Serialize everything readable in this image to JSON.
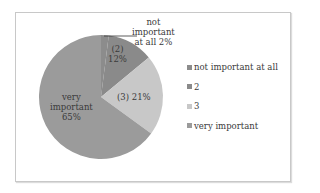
{
  "chart_data": {
    "type": "pie",
    "title": "",
    "categories": [
      "not important at all",
      "2",
      "3",
      "very important"
    ],
    "values": [
      2,
      12,
      21,
      65
    ],
    "unit": "%",
    "start_angle_deg": 0,
    "direction": "clockwise",
    "colors": [
      "#8c8c8c",
      "#8a8a8a",
      "#c8c8c8",
      "#9b9b9b"
    ],
    "data_labels": [
      {
        "text_lines": [
          "not",
          "important",
          "at all 2%"
        ],
        "has_leader_line": true
      },
      {
        "text_lines": [
          "(2)",
          "12%"
        ]
      },
      {
        "text_lines": [
          "(3) 21%"
        ]
      },
      {
        "text_lines": [
          "very",
          "important",
          "65%"
        ]
      }
    ],
    "legend": {
      "position": "right",
      "entries": [
        "not important at all",
        "2",
        "3",
        "very important"
      ]
    }
  },
  "labels": {
    "not_important": [
      "not",
      "important",
      "at all 2%"
    ],
    "two": [
      "(2)",
      "12%"
    ],
    "three": "(3) 21%",
    "very": [
      "very",
      "important",
      "65%"
    ]
  },
  "legend": {
    "items": [
      {
        "label": "not important at all",
        "color": "#8c8c8c"
      },
      {
        "label": "2",
        "color": "#8a8a8a"
      },
      {
        "label": "3",
        "color": "#c8c8c8"
      },
      {
        "label": "very important",
        "color": "#9b9b9b"
      }
    ]
  }
}
